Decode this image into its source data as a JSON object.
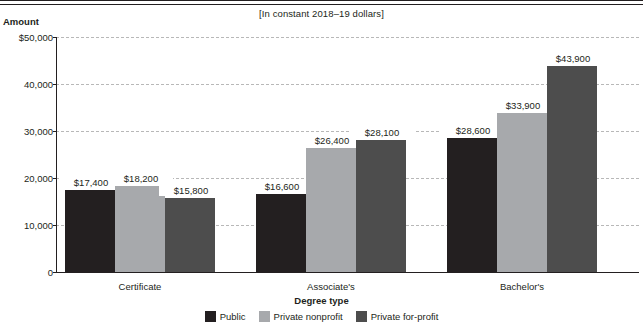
{
  "header": {
    "clipped_title": "Degree type and control of institution",
    "subtitle": "[In constant 2018–19 dollars]"
  },
  "axes": {
    "y_title": "Amount",
    "x_title": "Degree type",
    "y_ticks": [
      "$50,000",
      "40,000",
      "30,000",
      "20,000",
      "10,000",
      "0"
    ]
  },
  "legend": {
    "items": [
      {
        "label": "Public",
        "color": "#231f20",
        "swatch": "public"
      },
      {
        "label": "Private nonprofit",
        "color": "#a7a9ac",
        "swatch": "nonprofit"
      },
      {
        "label": "Private for-profit",
        "color": "#4d4d4d",
        "swatch": "forprofit"
      }
    ]
  },
  "chart_data": {
    "type": "bar",
    "title": "Degree type and control of institution",
    "subtitle": "[In constant 2018–19 dollars]",
    "xlabel": "Degree type",
    "ylabel": "Amount",
    "ylim": [
      0,
      50000
    ],
    "ytick_values": [
      0,
      10000,
      20000,
      30000,
      40000,
      50000
    ],
    "ytick_labels": [
      "0",
      "10,000",
      "20,000",
      "30,000",
      "40,000",
      "$50,000"
    ],
    "grid": true,
    "legend_position": "bottom",
    "categories": [
      "Certificate",
      "Associate's",
      "Bachelor's"
    ],
    "series": [
      {
        "name": "Public",
        "color": "#231f20",
        "values": [
          17400,
          16600,
          28600
        ],
        "labels": [
          "$17,400",
          "$16,600",
          "$28,600"
        ]
      },
      {
        "name": "Private nonprofit",
        "color": "#a7a9ac",
        "values": [
          18200,
          26400,
          33900
        ],
        "labels": [
          "$18,200",
          "$26,400",
          "$33,900"
        ]
      },
      {
        "name": "Private for-profit",
        "color": "#4d4d4d",
        "values": [
          15800,
          28100,
          43900
        ],
        "labels": [
          "$15,800",
          "$28,100",
          "$43,900"
        ]
      }
    ]
  }
}
